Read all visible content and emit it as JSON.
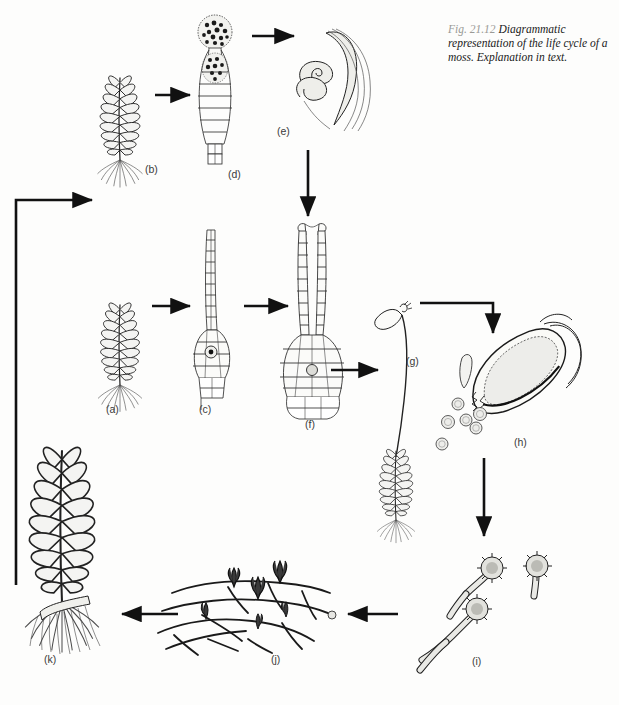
{
  "figure": {
    "number": "Fig. 21.12",
    "caption": "Diagrammatic representation of the life cycle of a moss. Explanation in text.",
    "width": 619,
    "height": 705,
    "background_color": "#fdfdfc",
    "ink_color": "#1a1a1a",
    "style": "line drawing / pen-and-ink diagram"
  },
  "stages": [
    {
      "id": "a",
      "label": "(a)",
      "name": "female-gametophyte",
      "x": 112,
      "y": 410,
      "art_x": 120,
      "art_y": 315
    },
    {
      "id": "b",
      "label": "(b)",
      "name": "male-gametophyte",
      "x": 145,
      "y": 170,
      "art_x": 120,
      "art_y": 90
    },
    {
      "id": "c",
      "label": "(c)",
      "name": "archegonium-with-egg",
      "x": 205,
      "y": 410,
      "art_x": 213,
      "art_y": 310
    },
    {
      "id": "d",
      "label": "(d)",
      "name": "antheridium-with-sperm",
      "x": 228,
      "y": 175,
      "art_x": 215,
      "art_y": 90
    },
    {
      "id": "e",
      "label": "(e)",
      "name": "sperm-cells",
      "x": 283,
      "y": 132,
      "art_x": 330,
      "art_y": 70
    },
    {
      "id": "f",
      "label": "(f)",
      "name": "fertilized-archegonium",
      "x": 310,
      "y": 425,
      "art_x": 313,
      "art_y": 305
    },
    {
      "id": "g",
      "label": "(g)",
      "name": "sporophyte-on-gametophyte",
      "x": 412,
      "y": 362,
      "art_x": 396,
      "art_y": 430
    },
    {
      "id": "h",
      "label": "(h)",
      "name": "capsule-releasing-spores",
      "x": 521,
      "y": 443,
      "art_x": 520,
      "art_y": 370
    },
    {
      "id": "i",
      "label": "(i)",
      "name": "germinating-spores",
      "x": 478,
      "y": 662,
      "art_x": 480,
      "art_y": 600
    },
    {
      "id": "j",
      "label": "(j)",
      "name": "protonema-with-buds",
      "x": 277,
      "y": 660,
      "art_x": 262,
      "art_y": 605
    },
    {
      "id": "k",
      "label": "(k)",
      "name": "mature-gametophyte",
      "x": 50,
      "y": 660,
      "art_x": 62,
      "art_y": 545
    }
  ],
  "arrows": [
    {
      "from": "b",
      "to": "d",
      "name": "arrow-b-to-d",
      "kind": "straight-right"
    },
    {
      "from": "d",
      "to": "e",
      "name": "arrow-d-to-e",
      "kind": "straight-right"
    },
    {
      "from": "e",
      "to": "f",
      "name": "arrow-e-to-f",
      "kind": "straight-down"
    },
    {
      "from": "a",
      "to": "c",
      "name": "arrow-a-to-c",
      "kind": "straight-right"
    },
    {
      "from": "c",
      "to": "f",
      "name": "arrow-c-to-f",
      "kind": "straight-right"
    },
    {
      "from": "f",
      "to": "g",
      "name": "arrow-f-to-g",
      "kind": "straight-right"
    },
    {
      "from": "g",
      "to": "h",
      "name": "arrow-g-to-h",
      "kind": "elbow-right-down"
    },
    {
      "from": "h",
      "to": "i",
      "name": "arrow-h-to-i",
      "kind": "straight-down"
    },
    {
      "from": "i",
      "to": "j",
      "name": "arrow-i-to-j",
      "kind": "straight-left"
    },
    {
      "from": "j",
      "to": "k",
      "name": "arrow-j-to-k",
      "kind": "straight-left"
    },
    {
      "from": "k",
      "to": "b",
      "name": "arrow-k-to-b",
      "kind": "elbow-left-up"
    }
  ]
}
